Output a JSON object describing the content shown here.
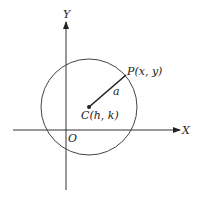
{
  "diagram": {
    "colors": {
      "stroke": "#333333",
      "text": "#222222",
      "background": "#ffffff"
    },
    "axes": {
      "x_label": "X",
      "y_label": "Y",
      "origin_label": "O"
    },
    "circle": {
      "center_label": "C(h, k)",
      "radius_label": "a"
    },
    "point": {
      "label": "P(x, y)"
    }
  }
}
